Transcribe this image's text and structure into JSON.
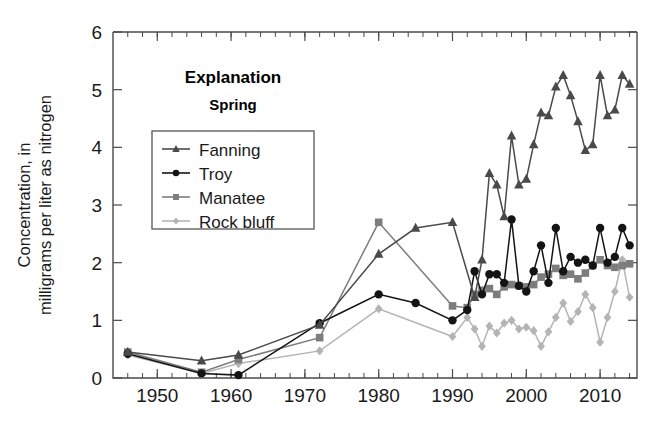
{
  "chart_data": {
    "type": "line",
    "title": "",
    "xlabel": "",
    "ylabel": "Concentration, in milligrams per liter as nitrogen",
    "ylabel_line1": "Concentration, in",
    "ylabel_line2": "milligrams per liter as nitrogen",
    "xlim": [
      1944,
      2015
    ],
    "ylim": [
      0,
      6
    ],
    "xticks": [
      1950,
      1960,
      1970,
      1980,
      1990,
      2000,
      2010
    ],
    "xtick_labels": [
      "1950",
      "1960",
      "1970",
      "1980",
      "1990",
      "2000",
      "2010"
    ],
    "yticks": [
      0,
      1,
      2,
      3,
      4,
      5,
      6
    ],
    "ytick_labels": [
      "0",
      "1",
      "2",
      "3",
      "4",
      "5",
      "6"
    ],
    "x_minor_tick_interval": 2,
    "grid": false,
    "legend_position": "upper-left-inside",
    "legend_title": "Explanation",
    "legend_subtitle": "Spring",
    "series": [
      {
        "name": "Fanning",
        "color": "#4a4a4a",
        "marker": "triangle",
        "points": [
          [
            1946,
            0.45
          ],
          [
            1956,
            0.3
          ],
          [
            1961,
            0.4
          ],
          [
            1972,
            0.92
          ],
          [
            1980,
            2.15
          ],
          [
            1985,
            2.6
          ],
          [
            1990,
            2.7
          ],
          [
            1993,
            1.4
          ],
          [
            1994,
            2.05
          ],
          [
            1995,
            3.55
          ],
          [
            1996,
            3.35
          ],
          [
            1997,
            2.8
          ],
          [
            1998,
            4.2
          ],
          [
            1999,
            3.35
          ],
          [
            2000,
            3.45
          ],
          [
            2001,
            4.05
          ],
          [
            2002,
            4.6
          ],
          [
            2003,
            4.55
          ],
          [
            2004,
            5.05
          ],
          [
            2005,
            5.25
          ],
          [
            2006,
            4.9
          ],
          [
            2007,
            4.45
          ],
          [
            2008,
            3.95
          ],
          [
            2009,
            4.05
          ],
          [
            2010,
            5.25
          ],
          [
            2011,
            4.55
          ],
          [
            2012,
            4.65
          ],
          [
            2013,
            5.25
          ],
          [
            2014,
            5.1
          ]
        ]
      },
      {
        "name": "Troy",
        "color": "#141414",
        "marker": "circle",
        "points": [
          [
            1946,
            0.42
          ],
          [
            1956,
            0.08
          ],
          [
            1961,
            0.05
          ],
          [
            1972,
            0.95
          ],
          [
            1980,
            1.45
          ],
          [
            1985,
            1.3
          ],
          [
            1990,
            1.0
          ],
          [
            1992,
            1.18
          ],
          [
            1993,
            1.85
          ],
          [
            1994,
            1.45
          ],
          [
            1995,
            1.8
          ],
          [
            1996,
            1.8
          ],
          [
            1997,
            1.65
          ],
          [
            1998,
            2.75
          ],
          [
            1999,
            1.6
          ],
          [
            2000,
            1.5
          ],
          [
            2001,
            1.85
          ],
          [
            2002,
            2.3
          ],
          [
            2003,
            1.65
          ],
          [
            2004,
            2.6
          ],
          [
            2005,
            1.85
          ],
          [
            2006,
            2.1
          ],
          [
            2007,
            2.0
          ],
          [
            2008,
            2.05
          ],
          [
            2009,
            1.95
          ],
          [
            2010,
            2.6
          ],
          [
            2011,
            2.0
          ],
          [
            2012,
            2.1
          ],
          [
            2013,
            2.6
          ],
          [
            2014,
            2.3
          ]
        ]
      },
      {
        "name": "Manatee",
        "color": "#7d7d7d",
        "marker": "square",
        "points": [
          [
            1946,
            0.45
          ],
          [
            1956,
            0.1
          ],
          [
            1961,
            0.32
          ],
          [
            1972,
            0.7
          ],
          [
            1980,
            2.7
          ],
          [
            1990,
            1.25
          ],
          [
            1992,
            1.22
          ],
          [
            1993,
            1.45
          ],
          [
            1994,
            1.52
          ],
          [
            1995,
            1.55
          ],
          [
            1996,
            1.45
          ],
          [
            1997,
            1.58
          ],
          [
            1998,
            1.62
          ],
          [
            1999,
            1.6
          ],
          [
            2000,
            1.58
          ],
          [
            2001,
            1.62
          ],
          [
            2002,
            1.75
          ],
          [
            2003,
            1.8
          ],
          [
            2004,
            1.9
          ],
          [
            2005,
            1.78
          ],
          [
            2006,
            1.8
          ],
          [
            2007,
            1.72
          ],
          [
            2008,
            1.82
          ],
          [
            2009,
            1.95
          ],
          [
            2010,
            2.05
          ],
          [
            2011,
            1.95
          ],
          [
            2012,
            1.92
          ],
          [
            2013,
            1.95
          ],
          [
            2014,
            1.98
          ]
        ]
      },
      {
        "name": "Rock bluff",
        "color": "#b4b4b4",
        "marker": "diamond",
        "points": [
          [
            1946,
            0.4
          ],
          [
            1956,
            0.08
          ],
          [
            1961,
            0.25
          ],
          [
            1972,
            0.47
          ],
          [
            1980,
            1.2
          ],
          [
            1990,
            0.72
          ],
          [
            1992,
            1.05
          ],
          [
            1993,
            0.85
          ],
          [
            1994,
            0.55
          ],
          [
            1995,
            0.9
          ],
          [
            1996,
            0.78
          ],
          [
            1997,
            0.95
          ],
          [
            1998,
            1.0
          ],
          [
            1999,
            0.85
          ],
          [
            2000,
            0.88
          ],
          [
            2001,
            0.82
          ],
          [
            2002,
            0.55
          ],
          [
            2003,
            0.8
          ],
          [
            2004,
            1.05
          ],
          [
            2005,
            1.3
          ],
          [
            2006,
            0.98
          ],
          [
            2007,
            1.15
          ],
          [
            2008,
            1.45
          ],
          [
            2009,
            1.22
          ],
          [
            2010,
            0.62
          ],
          [
            2011,
            1.05
          ],
          [
            2012,
            1.5
          ],
          [
            2013,
            2.05
          ],
          [
            2014,
            1.4
          ]
        ]
      }
    ]
  }
}
